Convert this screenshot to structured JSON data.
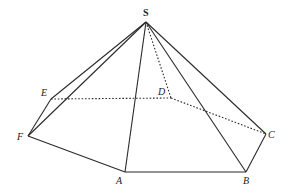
{
  "diagram": {
    "type": "hexagonal-pyramid",
    "colors": {
      "stroke": "#2a2a2a",
      "background": "#ffffff",
      "label": "#222222"
    },
    "vertices": {
      "S": {
        "label": "S",
        "x": 146,
        "y": 22,
        "lx": 143,
        "ly": 8
      },
      "A": {
        "label": "A",
        "x": 125,
        "y": 172,
        "lx": 116,
        "ly": 176
      },
      "B": {
        "label": "B",
        "x": 246,
        "y": 172,
        "lx": 243,
        "ly": 176
      },
      "C": {
        "label": "C",
        "x": 266,
        "y": 134,
        "lx": 268,
        "ly": 130
      },
      "D": {
        "label": "D",
        "x": 171,
        "y": 98,
        "lx": 158,
        "ly": 87
      },
      "E": {
        "label": "E",
        "x": 51,
        "y": 99,
        "lx": 41,
        "ly": 88
      },
      "F": {
        "label": "F",
        "x": 28,
        "y": 136,
        "lx": 17,
        "ly": 132
      }
    },
    "solid_edges": [
      [
        "S",
        "E"
      ],
      [
        "S",
        "F"
      ],
      [
        "S",
        "A"
      ],
      [
        "S",
        "B"
      ],
      [
        "S",
        "C"
      ],
      [
        "E",
        "F"
      ],
      [
        "F",
        "A"
      ],
      [
        "A",
        "B"
      ],
      [
        "B",
        "C"
      ]
    ],
    "dashed_edges": [
      [
        "S",
        "D"
      ],
      [
        "E",
        "D"
      ],
      [
        "D",
        "C"
      ]
    ]
  }
}
